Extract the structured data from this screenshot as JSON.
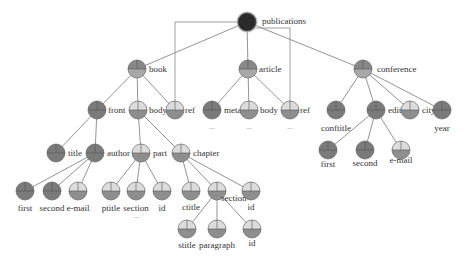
{
  "colors": {
    "dark": "#7a7a7a",
    "mid": "#9a9a9a",
    "light": "#dcdcdc",
    "root": "#2a2a2a",
    "edge": "#888888"
  },
  "nodes": [
    {
      "id": "publications",
      "label": "publications",
      "x": 247,
      "y": 22,
      "style": "root",
      "lx": 262,
      "ly": 24,
      "anchor": "start"
    },
    {
      "id": "book",
      "label": "book",
      "x": 137,
      "y": 69,
      "style": "mid",
      "lx": 149,
      "ly": 72,
      "anchor": "start"
    },
    {
      "id": "article",
      "label": "article",
      "x": 248,
      "y": 69,
      "style": "mid",
      "lx": 259,
      "ly": 72,
      "anchor": "start"
    },
    {
      "id": "conference",
      "label": "conference",
      "x": 363,
      "y": 69,
      "style": "mid",
      "lx": 377,
      "ly": 72,
      "anchor": "start"
    },
    {
      "id": "book-front",
      "label": "front",
      "x": 97,
      "y": 110,
      "style": "dark",
      "lx": 108,
      "ly": 113,
      "anchor": "start"
    },
    {
      "id": "book-body",
      "label": "body",
      "x": 138,
      "y": 110,
      "style": "light",
      "lx": 149,
      "ly": 113,
      "anchor": "start"
    },
    {
      "id": "book-ref",
      "label": "ref",
      "x": 175,
      "y": 110,
      "style": "light",
      "lx": 185,
      "ly": 113,
      "anchor": "start"
    },
    {
      "id": "article-meta",
      "label": "meta",
      "x": 212,
      "y": 110,
      "style": "dark",
      "lx": 224,
      "ly": 113,
      "anchor": "start"
    },
    {
      "id": "article-body",
      "label": "body",
      "x": 249,
      "y": 110,
      "style": "light",
      "lx": 260,
      "ly": 113,
      "anchor": "start"
    },
    {
      "id": "article-ref",
      "label": "ref",
      "x": 290,
      "y": 110,
      "style": "light",
      "lx": 300,
      "ly": 113,
      "anchor": "start"
    },
    {
      "id": "conftitle",
      "label": "conftitle",
      "x": 336,
      "y": 110,
      "style": "dark",
      "lx": 336,
      "ly": 131,
      "anchor": "middle"
    },
    {
      "id": "editor",
      "label": "editor",
      "x": 376,
      "y": 110,
      "style": "dark",
      "lx": 388,
      "ly": 113,
      "anchor": "start"
    },
    {
      "id": "city",
      "label": "city",
      "x": 410,
      "y": 110,
      "style": "light",
      "lx": 422,
      "ly": 113,
      "anchor": "start"
    },
    {
      "id": "year",
      "label": "year",
      "x": 442,
      "y": 110,
      "style": "dark",
      "lx": 442,
      "ly": 131,
      "anchor": "middle"
    },
    {
      "id": "title",
      "label": "title",
      "x": 56,
      "y": 153,
      "style": "dark",
      "lx": 68,
      "ly": 156,
      "anchor": "start"
    },
    {
      "id": "author",
      "label": "author",
      "x": 95,
      "y": 153,
      "style": "dark",
      "lx": 107,
      "ly": 156,
      "anchor": "start"
    },
    {
      "id": "part",
      "label": "part",
      "x": 141,
      "y": 153,
      "style": "light",
      "lx": 153,
      "ly": 156,
      "anchor": "start"
    },
    {
      "id": "chapter",
      "label": "chapter",
      "x": 181,
      "y": 153,
      "style": "light",
      "lx": 193,
      "ly": 156,
      "anchor": "start"
    },
    {
      "id": "author-first",
      "label": "first",
      "x": 25,
      "y": 191,
      "style": "dark",
      "lx": 25,
      "ly": 211,
      "anchor": "middle"
    },
    {
      "id": "author-second",
      "label": "second",
      "x": 52,
      "y": 191,
      "style": "dark",
      "lx": 52,
      "ly": 211,
      "anchor": "middle"
    },
    {
      "id": "author-email",
      "label": "e-mail",
      "x": 78,
      "y": 191,
      "style": "light",
      "lx": 78,
      "ly": 211,
      "anchor": "middle"
    },
    {
      "id": "part-ptitle",
      "label": "ptitle",
      "x": 111,
      "y": 191,
      "style": "light",
      "lx": 111,
      "ly": 211,
      "anchor": "middle"
    },
    {
      "id": "part-section",
      "label": "section",
      "x": 136,
      "y": 191,
      "style": "light",
      "lx": 136,
      "ly": 211,
      "anchor": "middle"
    },
    {
      "id": "part-id",
      "label": "id",
      "x": 162,
      "y": 191,
      "style": "light",
      "lx": 162,
      "ly": 211,
      "anchor": "middle"
    },
    {
      "id": "chapter-ctitle",
      "label": "ctitle",
      "x": 191,
      "y": 191,
      "style": "light",
      "lx": 191,
      "ly": 210,
      "anchor": "middle"
    },
    {
      "id": "chapter-section",
      "label": "section",
      "x": 217,
      "y": 191,
      "style": "light",
      "lx": 221,
      "ly": 201,
      "anchor": "start"
    },
    {
      "id": "chapter-id",
      "label": "id",
      "x": 251,
      "y": 191,
      "style": "light",
      "lx": 251,
      "ly": 210,
      "anchor": "middle"
    },
    {
      "id": "section-stitle",
      "label": "stitle",
      "x": 187,
      "y": 229,
      "style": "light",
      "lx": 187,
      "ly": 248,
      "anchor": "middle"
    },
    {
      "id": "section-paragraph",
      "label": "paragraph",
      "x": 217,
      "y": 229,
      "style": "light",
      "lx": 217,
      "ly": 248,
      "anchor": "middle"
    },
    {
      "id": "section-id",
      "label": "id",
      "x": 252,
      "y": 229,
      "style": "light",
      "lx": 252,
      "ly": 246,
      "anchor": "middle"
    },
    {
      "id": "editor-first",
      "label": "first",
      "x": 328,
      "y": 150,
      "style": "dark",
      "lx": 328,
      "ly": 167,
      "anchor": "middle"
    },
    {
      "id": "editor-second",
      "label": "second",
      "x": 365,
      "y": 150,
      "style": "dark",
      "lx": 365,
      "ly": 166,
      "anchor": "middle"
    },
    {
      "id": "editor-email",
      "label": "e-mail",
      "x": 401,
      "y": 150,
      "style": "light",
      "lx": 401,
      "ly": 163,
      "anchor": "middle"
    }
  ],
  "edges": [
    [
      "publications",
      "book"
    ],
    [
      "publications",
      "article"
    ],
    [
      "publications",
      "conference"
    ],
    [
      "book",
      "book-front"
    ],
    [
      "book",
      "book-body"
    ],
    [
      "book",
      "book-ref"
    ],
    [
      "article",
      "article-meta"
    ],
    [
      "article",
      "article-body"
    ],
    [
      "article",
      "article-ref"
    ],
    [
      "conference",
      "conftitle"
    ],
    [
      "conference",
      "editor"
    ],
    [
      "conference",
      "city"
    ],
    [
      "conference",
      "year"
    ],
    [
      "book-front",
      "title"
    ],
    [
      "book-front",
      "author"
    ],
    [
      "book-body",
      "part"
    ],
    [
      "book-body",
      "chapter"
    ],
    [
      "author",
      "author-first"
    ],
    [
      "author",
      "author-second"
    ],
    [
      "author",
      "author-email"
    ],
    [
      "part",
      "part-ptitle"
    ],
    [
      "part",
      "part-section"
    ],
    [
      "part",
      "part-id"
    ],
    [
      "chapter",
      "chapter-ctitle"
    ],
    [
      "chapter",
      "chapter-section"
    ],
    [
      "chapter",
      "chapter-id"
    ],
    [
      "chapter-section",
      "section-stitle"
    ],
    [
      "chapter-section",
      "section-paragraph"
    ],
    [
      "chapter-section",
      "section-id"
    ],
    [
      "editor",
      "editor-first"
    ],
    [
      "editor",
      "editor-second"
    ],
    [
      "editor",
      "editor-email"
    ]
  ],
  "reference_links": [
    {
      "from": "publications",
      "to": "book-ref",
      "path": "M240,22 L175,22 L175,103"
    },
    {
      "from": "publications",
      "to": "article-ref",
      "path": "M254,28 L290,28 L290,103"
    }
  ],
  "ellipses": [
    {
      "text": "...",
      "x": 212,
      "y": 129
    },
    {
      "text": "...",
      "x": 249,
      "y": 129
    },
    {
      "text": "...",
      "x": 290,
      "y": 129
    },
    {
      "text": "...",
      "x": 137,
      "y": 218
    }
  ]
}
